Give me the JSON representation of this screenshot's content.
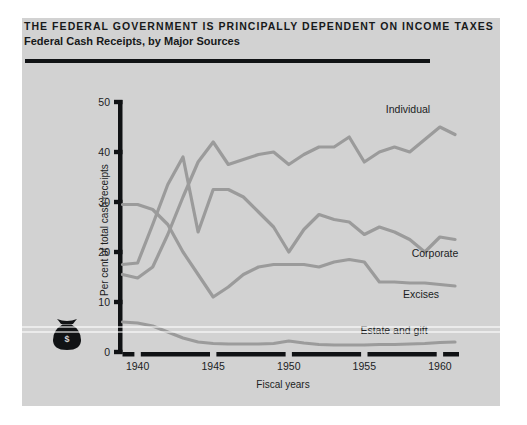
{
  "figure": {
    "headline": "THE FEDERAL GOVERNMENT IS PRINCIPALLY DEPENDENT ON INCOME TAXES",
    "subhead": "Federal Cash Receipts, by Major Sources",
    "bag_icon": "money-bag-icon",
    "bag_symbol": "$"
  },
  "chart_data": {
    "type": "line",
    "title": "THE FEDERAL GOVERNMENT IS PRINCIPALLY DEPENDENT ON INCOME TAXES",
    "subtitle": "Federal Cash Receipts, by Major Sources",
    "xlabel": "Fiscal years",
    "ylabel": "Per cent of total cash receipts",
    "xlim": [
      1939,
      1961
    ],
    "ylim": [
      0,
      50
    ],
    "xticks": [
      1940,
      1945,
      1950,
      1955,
      1960
    ],
    "xtick_labels": [
      "1940",
      "1945",
      "1950",
      "1955",
      "1960"
    ],
    "yticks": [
      0,
      10,
      20,
      30,
      40,
      50
    ],
    "ytick_labels": [
      "0",
      "10",
      "20",
      "30",
      "40",
      "50"
    ],
    "grid": false,
    "legend": "inline-labels",
    "line_color": "#9b9b9b",
    "x": [
      1939,
      1940,
      1941,
      1942,
      1943,
      1944,
      1945,
      1946,
      1947,
      1948,
      1949,
      1950,
      1951,
      1952,
      1953,
      1954,
      1955,
      1956,
      1957,
      1958,
      1959,
      1960,
      1961
    ],
    "series": [
      {
        "name": "Individual",
        "label": "Individual",
        "values": [
          15.5,
          14.8,
          17.0,
          23.5,
          31.0,
          38.0,
          42.0,
          37.5,
          38.5,
          39.5,
          40.0,
          37.5,
          39.5,
          41.0,
          41.0,
          43.0,
          38.0,
          40.0,
          41.0,
          40.0,
          42.5,
          45.0,
          43.5
        ]
      },
      {
        "name": "Corporate",
        "label": "Corporate",
        "values": [
          17.5,
          17.8,
          25.5,
          33.5,
          39.0,
          24.0,
          32.5,
          32.5,
          31.0,
          28.0,
          25.0,
          20.0,
          24.5,
          27.5,
          26.5,
          26.0,
          23.5,
          25.0,
          24.0,
          22.5,
          20.0,
          23.0,
          22.5
        ]
      },
      {
        "name": "Excises",
        "label": "Excises",
        "values": [
          29.5,
          29.5,
          28.5,
          25.5,
          20.0,
          15.5,
          11.0,
          13.0,
          15.5,
          17.0,
          17.5,
          17.5,
          17.5,
          17.0,
          18.0,
          18.5,
          18.0,
          14.0,
          14.0,
          13.8,
          13.8,
          13.5,
          13.2
        ]
      },
      {
        "name": "Estate and gift",
        "label": "Estate and gift",
        "values": [
          6.0,
          5.8,
          5.2,
          4.0,
          2.8,
          2.0,
          1.7,
          1.6,
          1.6,
          1.6,
          1.7,
          2.2,
          1.8,
          1.5,
          1.4,
          1.4,
          1.4,
          1.5,
          1.5,
          1.6,
          1.7,
          1.9,
          2.0
        ]
      }
    ]
  }
}
